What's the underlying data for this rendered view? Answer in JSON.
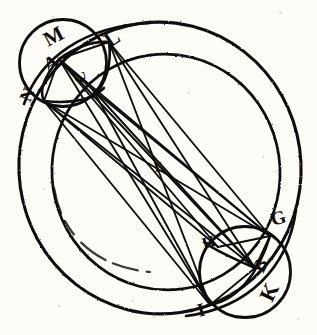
{
  "figure": {
    "domain": "Diagram",
    "width": 317,
    "height": 335,
    "background_color": "#fdfcf7",
    "ink_color": "#100d0a",
    "style": "historical engraving / woodcut line drawing"
  },
  "labels": [
    {
      "id": "M",
      "text": "M",
      "x": 48,
      "y": 47,
      "rotation": -28,
      "size": 20
    },
    {
      "id": "A",
      "text": "A",
      "x": 48,
      "y": 72,
      "rotation": -28,
      "size": 20
    },
    {
      "id": "N",
      "text": "N",
      "x": 33,
      "y": 102,
      "rotation": -62,
      "size": 17
    },
    {
      "id": "L",
      "text": "L",
      "x": 112,
      "y": 47,
      "rotation": -35,
      "size": 20
    },
    {
      "id": "C",
      "text": "C",
      "x": 88,
      "y": 80,
      "rotation": -95,
      "size": 16
    },
    {
      "id": "E",
      "text": "E",
      "x": 158,
      "y": 170,
      "rotation": -8,
      "size": 13
    },
    {
      "id": "G",
      "text": "G",
      "x": 275,
      "y": 225,
      "rotation": -18,
      "size": 18
    },
    {
      "id": "H",
      "text": "H",
      "x": 207,
      "y": 248,
      "rotation": -18,
      "size": 16
    },
    {
      "id": "B",
      "text": "B",
      "x": 268,
      "y": 273,
      "rotation": -62,
      "size": 18
    },
    {
      "id": "K",
      "text": "K",
      "x": 277,
      "y": 302,
      "rotation": -62,
      "size": 20
    },
    {
      "id": "I",
      "text": "I",
      "x": 201,
      "y": 316,
      "rotation": -18,
      "size": 18
    }
  ],
  "circles": [
    {
      "name": "outer-great-circle",
      "cx": 160,
      "cy": 168,
      "r": 140,
      "stroke_width": 3.0
    },
    {
      "name": "inner-great-circle",
      "cx": 164,
      "cy": 172,
      "r": 113,
      "stroke_width": 2.6
    },
    {
      "name": "upper-left-epicycle",
      "cx": 63,
      "cy": 63,
      "r": 43,
      "stroke_width": 2.6
    },
    {
      "name": "lower-right-epicycle",
      "cx": 245,
      "cy": 271,
      "r": 45,
      "stroke_width": 2.6
    }
  ],
  "points": [
    {
      "id": "A",
      "x": 59,
      "y": 59,
      "role": "upper hub vertex"
    },
    {
      "id": "N",
      "x": 44,
      "y": 101,
      "role": "lower-left hub vertex"
    },
    {
      "id": "M",
      "x": 46,
      "y": 38,
      "role": "upper-left circle point"
    },
    {
      "id": "L",
      "x": 108,
      "y": 42,
      "role": "upper-right arc intersection"
    },
    {
      "id": "C",
      "x": 93,
      "y": 85,
      "role": "inner arc point"
    },
    {
      "id": "E",
      "x": 160,
      "y": 168,
      "role": "center of figure"
    },
    {
      "id": "G",
      "x": 270,
      "y": 236,
      "role": "right hub vertex"
    },
    {
      "id": "H",
      "x": 218,
      "y": 247,
      "role": "intersection point"
    },
    {
      "id": "B",
      "x": 255,
      "y": 268,
      "role": "lower-right hub vertex"
    },
    {
      "id": "K",
      "x": 272,
      "y": 294,
      "role": "lower-right circle point"
    },
    {
      "id": "I",
      "x": 210,
      "y": 305,
      "role": "bottom hub vertex"
    }
  ],
  "chords": [
    {
      "from": "A",
      "to": "G"
    },
    {
      "from": "A",
      "to": "B"
    },
    {
      "from": "A",
      "to": "I"
    },
    {
      "from": "A",
      "to": "H"
    },
    {
      "from": "A",
      "to": "L"
    },
    {
      "from": "A",
      "to": "C"
    },
    {
      "from": "A",
      "to": "N"
    },
    {
      "from": "N",
      "to": "G"
    },
    {
      "from": "N",
      "to": "B"
    },
    {
      "from": "N",
      "to": "I"
    },
    {
      "from": "N",
      "to": "H"
    },
    {
      "from": "N",
      "to": "L"
    },
    {
      "from": "L",
      "to": "B"
    },
    {
      "from": "L",
      "to": "I"
    },
    {
      "from": "L",
      "to": "G"
    },
    {
      "from": "C",
      "to": "G"
    },
    {
      "from": "C",
      "to": "B"
    },
    {
      "from": "C",
      "to": "I"
    }
  ],
  "arcs": [
    {
      "name": "arc-through-L-A",
      "d": "M 20 96 C 46 46, 88 22, 152 24"
    },
    {
      "name": "arc-M-N-chord",
      "d": "M 59 59 C 46 74, 38 90, 44 101"
    }
  ]
}
